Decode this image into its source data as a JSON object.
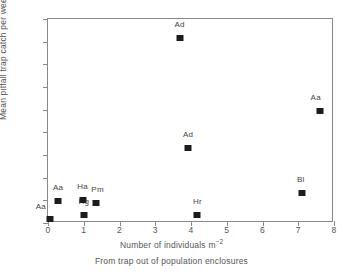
{
  "chart_data": {
    "type": "scatter",
    "title": "",
    "xlabel": "Number of individuals m",
    "xlabel_exponent": "−2",
    "ylabel": "Mean pitfall trap catch per week",
    "caption": "From  trap out of population enclosures",
    "xlim": [
      0,
      8
    ],
    "ylim": [
      0,
      1.8
    ],
    "grid": false,
    "legend": "none",
    "xticks": [
      "0",
      "1",
      "2",
      "3",
      "4",
      "5",
      "6",
      "7",
      "8"
    ],
    "xtick_values": [
      0,
      1,
      2,
      3,
      4,
      5,
      6,
      7,
      8
    ],
    "yticks": [
      "0",
      "0.2",
      "0.4",
      "0.6",
      "0.8",
      "1",
      "1.2",
      "1.4",
      "1.6",
      "1.8"
    ],
    "ytick_values": [
      0,
      0.2,
      0.4,
      0.6,
      0.8,
      1.0,
      1.2,
      1.4,
      1.6,
      1.8
    ],
    "marker_color": "#1c1c1c",
    "marker_shape": "square",
    "points": [
      {
        "label": "Aa",
        "x": 0.05,
        "y": 0.035,
        "label_dx": -9,
        "label_dy": -4
      },
      {
        "label": "Aa",
        "x": 0.28,
        "y": 0.198,
        "label_dx": 0,
        "label_dy": -5
      },
      {
        "label": "Hg",
        "x": 1.0,
        "y": 0.068,
        "label_dx": 0,
        "label_dy": -5
      },
      {
        "label": "Ha",
        "x": 0.97,
        "y": 0.2,
        "label_dx": 0,
        "label_dy": -5
      },
      {
        "label": "Pm",
        "x": 1.33,
        "y": 0.175,
        "label_dx": 2,
        "label_dy": -5
      },
      {
        "label": "Ad",
        "x": 3.68,
        "y": 1.63,
        "label_dx": 0,
        "label_dy": -5
      },
      {
        "label": "Ad",
        "x": 3.92,
        "y": 0.66,
        "label_dx": 0,
        "label_dy": -5
      },
      {
        "label": "Hr",
        "x": 4.18,
        "y": 0.068,
        "label_dx": 0,
        "label_dy": -5
      },
      {
        "label": "Bl",
        "x": 7.1,
        "y": 0.262,
        "label_dx": -1,
        "label_dy": -5
      },
      {
        "label": "Aa",
        "x": 7.6,
        "y": 0.985,
        "label_dx": -4,
        "label_dy": -5
      }
    ]
  }
}
